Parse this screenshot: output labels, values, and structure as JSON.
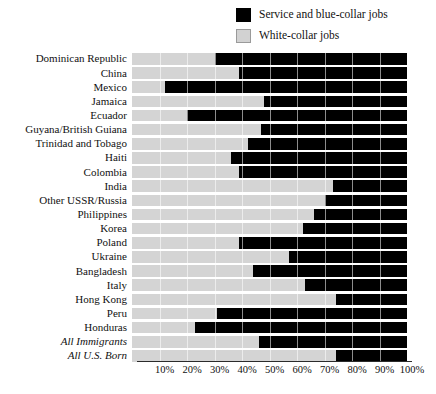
{
  "legend": {
    "position": "top-right",
    "items": [
      {
        "label": "Service and blue-collar jobs",
        "swatch": "dark-square-icon",
        "color": "#000000"
      },
      {
        "label": "White-collar jobs",
        "swatch": "light-square-icon",
        "color": "#d2d2d2"
      }
    ]
  },
  "axis": {
    "ticks": [
      "10%",
      "20%",
      "30%",
      "40%",
      "50%",
      "60%",
      "70%",
      "80%",
      "90%",
      "100%"
    ]
  },
  "chart_data": {
    "type": "bar",
    "orientation": "horizontal",
    "stacked": true,
    "normalized": true,
    "title": "",
    "subtitle": "",
    "xlabel": "",
    "ylabel": "",
    "xlim": [
      0,
      100
    ],
    "grid": true,
    "legend_position": "top-right",
    "categories": [
      "Dominican Republic",
      "China",
      "Mexico",
      "Jamaica",
      "Ecuador",
      "Guyana/British Guiana",
      "Trinidad and Tobago",
      "Haiti",
      "Colombia",
      "India",
      "Other USSR/Russia",
      "Philippines",
      "Korea",
      "Poland",
      "Ukraine",
      "Bangladesh",
      "Italy",
      "Hong Kong",
      "Peru",
      "Honduras",
      "All Immigrants",
      "All U.S. Born"
    ],
    "emphasized_categories": [
      "All Immigrants",
      "All U.S. Born"
    ],
    "series": [
      {
        "name": "White-collar jobs",
        "color": "#d4d4d4",
        "values": [
          30,
          39,
          12,
          48,
          20,
          47,
          42,
          36,
          39,
          73,
          70,
          66,
          62,
          39,
          57,
          44,
          63,
          74,
          31,
          23,
          46,
          74
        ]
      },
      {
        "name": "Service and blue-collar jobs",
        "color": "#000000",
        "values": [
          70,
          61,
          88,
          52,
          80,
          53,
          58,
          64,
          61,
          27,
          30,
          34,
          38,
          61,
          43,
          56,
          37,
          26,
          69,
          77,
          54,
          26
        ]
      }
    ],
    "gridlines": [
      10,
      20,
      30,
      40,
      50,
      60,
      70,
      80,
      90
    ]
  }
}
